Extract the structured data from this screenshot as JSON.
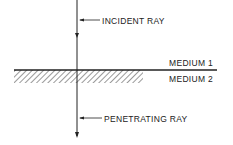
{
  "diagram": {
    "labels": {
      "incident_ray": "INCIDENT RAY",
      "medium_1": "MEDIUM 1",
      "medium_2": "MEDIUM 2",
      "penetrating_ray": "PENETRATING RAY"
    },
    "colors": {
      "line": "#222222",
      "hatch": "#555555",
      "background": "#ffffff"
    }
  }
}
